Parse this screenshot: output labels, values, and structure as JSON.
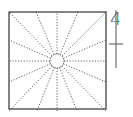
{
  "diagram": {
    "square": {
      "x": 9,
      "y": 12,
      "size": 97,
      "stroke": "#333333"
    },
    "circle": {
      "cx": 57,
      "cy": 61,
      "r": 7,
      "stroke": "#333333"
    },
    "ray_style": {
      "stroke": "#555555",
      "dash": "1.2,1.6"
    },
    "ray_targets": [
      [
        9,
        12
      ],
      [
        36,
        12
      ],
      [
        57,
        12
      ],
      [
        78,
        12
      ],
      [
        106,
        12
      ],
      [
        106,
        40
      ],
      [
        106,
        61
      ],
      [
        106,
        82
      ],
      [
        106,
        111
      ],
      [
        77,
        111
      ],
      [
        57,
        111
      ],
      [
        37,
        111
      ],
      [
        9,
        111
      ],
      [
        9,
        82
      ],
      [
        9,
        61
      ],
      [
        9,
        40
      ]
    ],
    "marker": {
      "label": "4",
      "line_x": 116,
      "line_top": 10,
      "line_bottom": 68,
      "tick_y": 44,
      "tick_half_width": 7,
      "color": "#555555"
    }
  }
}
